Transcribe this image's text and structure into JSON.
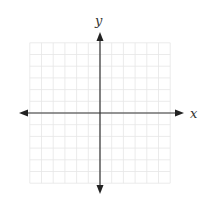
{
  "diagram": {
    "type": "coordinate-plane",
    "x_axis": {
      "label": "x",
      "arrows": "both"
    },
    "y_axis": {
      "label": "y",
      "arrows": "both"
    },
    "grid": {
      "columns": 12,
      "rows": 12,
      "columns_left_of_origin": 6,
      "columns_right_of_origin": 6,
      "rows_above_origin": 6,
      "rows_below_origin": 6,
      "tick_labels": "none"
    },
    "colors": {
      "grid_line": "#e6e6e6",
      "axis": "#333333",
      "background": "#ffffff"
    }
  }
}
